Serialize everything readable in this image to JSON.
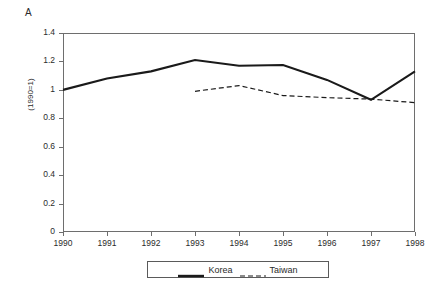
{
  "figure": {
    "panel_label": "A"
  },
  "axes": {
    "y_title": "(1990=1)",
    "y_ticks": [
      "0",
      "0.2",
      "0.4",
      "0.6",
      "0.8",
      "1",
      "1.2",
      "1.4"
    ],
    "x_ticks": [
      "1990",
      "1991",
      "1992",
      "1993",
      "1994",
      "1995",
      "1996",
      "1997",
      "1998"
    ]
  },
  "legend": {
    "entries": [
      {
        "label": "Korea",
        "style": "solid"
      },
      {
        "label": "Taiwan",
        "style": "dashed"
      }
    ]
  },
  "colors": {
    "line": "#1a1a1a",
    "frame": "#6e6e6e",
    "text": "#2b2b2b",
    "background": "#ffffff"
  },
  "chart_data": {
    "type": "line",
    "title": "A",
    "xlabel": "",
    "ylabel": "(1990=1)",
    "x": [
      1990,
      1991,
      1992,
      1993,
      1994,
      1995,
      1996,
      1997,
      1998
    ],
    "categories": [
      "1990",
      "1991",
      "1992",
      "1993",
      "1994",
      "1995",
      "1996",
      "1997",
      "1998"
    ],
    "xlim": [
      1990,
      1998
    ],
    "ylim": [
      0,
      1.4
    ],
    "y_ticks": [
      0,
      0.2,
      0.4,
      0.6,
      0.8,
      1,
      1.2,
      1.4
    ],
    "grid": false,
    "legend_position": "bottom",
    "series": [
      {
        "name": "Korea",
        "style": "solid",
        "x": [
          1990,
          1991,
          1992,
          1993,
          1994,
          1995,
          1996,
          1997,
          1998
        ],
        "values": [
          1.0,
          1.08,
          1.13,
          1.21,
          1.17,
          1.175,
          1.07,
          0.93,
          1.13
        ]
      },
      {
        "name": "Taiwan",
        "style": "dashed",
        "x": [
          1993,
          1994,
          1995,
          1996,
          1997,
          1998
        ],
        "values": [
          0.99,
          1.03,
          0.96,
          0.945,
          0.935,
          0.91
        ]
      }
    ]
  }
}
